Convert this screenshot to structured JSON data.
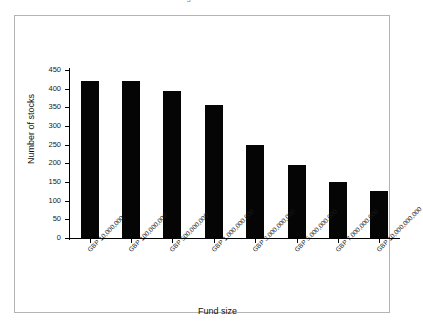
{
  "page": {
    "clipped_title": "The intelligent fund investor"
  },
  "chart_data": {
    "type": "bar",
    "title": "",
    "xlabel": "Fund size",
    "ylabel": "Number of stocks",
    "ylim": [
      0,
      450
    ],
    "ytick_step": 50,
    "grid": false,
    "legend": "none",
    "bar_color": "#050505",
    "categories": [
      "GBP 10,000,000",
      "GBP 100,000,000",
      "GBP 500,000,000",
      "GBP 1,000,000,000",
      "GBP 3,000,000,000",
      "GBP 5,000,000,000",
      "GBP 7,000,000,000",
      "GBP 10,000,000,000"
    ],
    "values": [
      420,
      420,
      395,
      355,
      248,
      195,
      150,
      125
    ],
    "yticks": [
      0,
      50,
      100,
      150,
      200,
      250,
      300,
      350,
      400,
      450
    ]
  }
}
